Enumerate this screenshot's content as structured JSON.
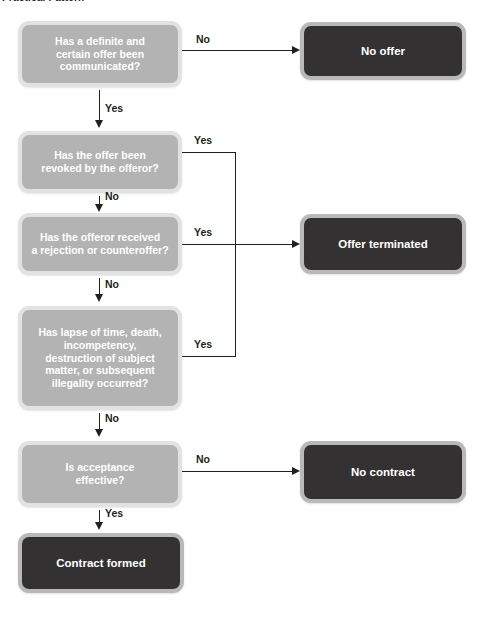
{
  "title": "Practical Pattern",
  "colors": {
    "decision_fill": "#b3b3b3",
    "decision_border": "#e2e2e2",
    "terminal_fill": "#333132",
    "terminal_border": "#b9b9b9",
    "line": "#231f20",
    "node_text": "#ffffff",
    "label_text": "#231f20",
    "background": "#ffffff"
  },
  "nodes": {
    "offer_communicated": {
      "label": "Has a definite and\ncertain offer been\ncommunicated?",
      "type": "decision"
    },
    "offer_revoked": {
      "label": "Has the offer been\nrevoked by the offeror?",
      "type": "decision"
    },
    "rejection_counteroffer": {
      "label": "Has the offeror received\na rejection or counteroffer?",
      "type": "decision"
    },
    "lapse_death": {
      "label": "Has lapse of time, death,\nincompetency,\ndestruction of subject\nmatter, or subsequent\nillegality occurred?",
      "type": "decision"
    },
    "acceptance_effective": {
      "label": "Is acceptance\neffective?",
      "type": "decision"
    },
    "no_offer": {
      "label": "No offer",
      "type": "terminal"
    },
    "offer_terminated": {
      "label": "Offer terminated",
      "type": "terminal"
    },
    "no_contract": {
      "label": "No contract",
      "type": "terminal"
    },
    "contract_formed": {
      "label": "Contract formed",
      "type": "terminal"
    }
  },
  "edges": {
    "offer_communicated_no": "No",
    "offer_communicated_yes": "Yes",
    "offer_revoked_yes": "Yes",
    "offer_revoked_no": "No",
    "rejection_yes": "Yes",
    "rejection_no": "No",
    "lapse_yes": "Yes",
    "lapse_no": "No",
    "acceptance_no": "No",
    "acceptance_yes": "Yes"
  }
}
